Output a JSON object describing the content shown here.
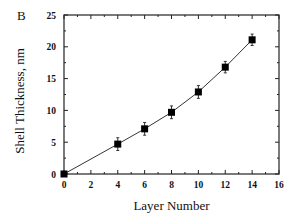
{
  "chart_data": {
    "type": "line",
    "panel_label": "B",
    "title": "",
    "xlabel": "Layer Number",
    "ylabel": "Shell Thickness, nm",
    "xlim": [
      0,
      16
    ],
    "ylim": [
      0,
      25
    ],
    "xticks": [
      0,
      2,
      4,
      6,
      8,
      10,
      12,
      14,
      16
    ],
    "yticks": [
      0,
      5,
      10,
      15,
      20,
      25
    ],
    "grid": false,
    "legend": null,
    "marker": "filled-square",
    "series": [
      {
        "name": "Shell Thickness",
        "x": [
          0,
          4,
          6,
          8,
          10,
          12,
          14
        ],
        "y": [
          0,
          4.7,
          7.1,
          9.7,
          12.9,
          16.8,
          21.1
        ],
        "error": [
          0.2,
          1.0,
          1.0,
          1.0,
          1.0,
          0.9,
          0.9
        ]
      }
    ]
  }
}
